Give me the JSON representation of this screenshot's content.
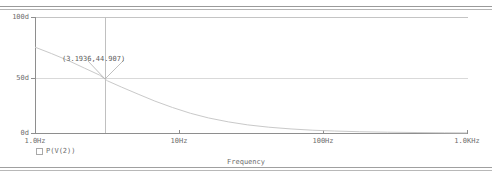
{
  "window": {
    "frame_style": "double-hairline"
  },
  "chart_data": {
    "type": "line",
    "title": "",
    "xlabel": "Frequency",
    "ylabel": "",
    "xscale": "log",
    "xlim": [
      1,
      1000
    ],
    "ylim": [
      0,
      100
    ],
    "grid": true,
    "legend_position": "bottom-left",
    "xticks": [
      {
        "label": "1.0Hz",
        "value": 1
      },
      {
        "label": "10Hz",
        "value": 10
      },
      {
        "label": "100Hz",
        "value": 100
      },
      {
        "label": "1.0KHz",
        "value": 1000
      }
    ],
    "yticks": [
      {
        "label": "100d",
        "value": 100
      },
      {
        "label": "50d",
        "value": 50
      },
      {
        "label": "0d",
        "value": 0
      }
    ],
    "series": [
      {
        "name": "P(V(2))",
        "color": "#c9c9c9",
        "points": [
          {
            "x": 1,
            "y": 74.0
          },
          {
            "x": 1.3,
            "y": 68.5
          },
          {
            "x": 1.7,
            "y": 62.5
          },
          {
            "x": 2.2,
            "y": 56.0
          },
          {
            "x": 2.8,
            "y": 50.0
          },
          {
            "x": 3.1936,
            "y": 44.907
          },
          {
            "x": 4.0,
            "y": 39.5
          },
          {
            "x": 5.2,
            "y": 33.5
          },
          {
            "x": 6.8,
            "y": 27.5
          },
          {
            "x": 9.0,
            "y": 22.0
          },
          {
            "x": 12.0,
            "y": 17.0
          },
          {
            "x": 16.0,
            "y": 13.0
          },
          {
            "x": 22.0,
            "y": 9.6
          },
          {
            "x": 30.0,
            "y": 7.0
          },
          {
            "x": 42.0,
            "y": 5.0
          },
          {
            "x": 60.0,
            "y": 3.5
          },
          {
            "x": 85.0,
            "y": 2.4
          },
          {
            "x": 120.0,
            "y": 1.7
          },
          {
            "x": 180.0,
            "y": 1.1
          },
          {
            "x": 280.0,
            "y": 0.7
          },
          {
            "x": 450.0,
            "y": 0.4
          },
          {
            "x": 700.0,
            "y": 0.2
          },
          {
            "x": 1000.0,
            "y": 0.1
          }
        ]
      }
    ],
    "annotations": [
      {
        "name": "cursor-readout",
        "label": "(3.1936,44.907)",
        "x": 3.1936,
        "y": 44.907
      }
    ]
  },
  "legend": {
    "entries": [
      {
        "label": "P(V(2))",
        "marker": "square-outline"
      }
    ]
  }
}
